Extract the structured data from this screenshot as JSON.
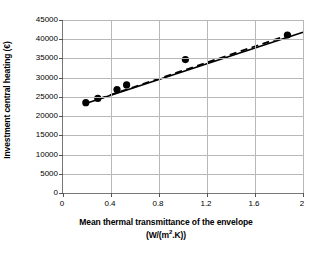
{
  "chart_data": {
    "type": "scatter",
    "title": "",
    "xlabel": "Mean thermal transmittance of the envelope (W/(m2.K))",
    "ylabel": "Investment central heating (€)",
    "xlim": [
      0,
      2
    ],
    "ylim": [
      0,
      45000
    ],
    "grid": true,
    "legend": "none",
    "x": [
      0.19,
      0.29,
      0.45,
      0.53,
      1.02,
      1.87
    ],
    "y": [
      23500,
      24600,
      26900,
      28100,
      34700,
      41100
    ],
    "points": [
      {
        "x": 0.19,
        "y": 23500
      },
      {
        "x": 0.29,
        "y": 24600
      },
      {
        "x": 0.45,
        "y": 26900
      },
      {
        "x": 0.53,
        "y": 28100
      },
      {
        "x": 1.02,
        "y": 34700
      },
      {
        "x": 1.87,
        "y": 41100
      }
    ],
    "series": [
      {
        "name": "data-points",
        "style": "markers",
        "marker": "filled-circle",
        "color": "#000000",
        "values": [
          23500,
          24600,
          26900,
          28100,
          34700,
          41100
        ]
      },
      {
        "name": "solid-trend-line",
        "style": "solid",
        "color": "#000000",
        "endpoints": [
          {
            "x": 0.17,
            "y": 23100
          },
          {
            "x": 2.0,
            "y": 41800
          }
        ]
      },
      {
        "name": "dashed-trend-line",
        "style": "dashed",
        "color": "#000000",
        "endpoints": [
          {
            "x": 0.3,
            "y": 24500
          },
          {
            "x": 1.9,
            "y": 41300
          }
        ]
      }
    ],
    "x_ticks": [
      {
        "value": 0,
        "label": "0"
      },
      {
        "value": 0.4,
        "label": "0.4"
      },
      {
        "value": 0.8,
        "label": "0.8"
      },
      {
        "value": 1.2,
        "label": "1.2"
      },
      {
        "value": 1.6,
        "label": "1.6"
      },
      {
        "value": 2,
        "label": "2"
      }
    ],
    "y_ticks": [
      {
        "value": 45000,
        "label": "45000"
      },
      {
        "value": 40000,
        "label": "40000"
      },
      {
        "value": 35000,
        "label": "35000"
      },
      {
        "value": 30000,
        "label": "30000"
      },
      {
        "value": 25000,
        "label": "25000"
      },
      {
        "value": 20000,
        "label": "20000"
      },
      {
        "value": 15000,
        "label": "15000"
      },
      {
        "value": 10000,
        "label": "10000"
      },
      {
        "value": 5000,
        "label": "5000"
      },
      {
        "value": 0,
        "label": "0"
      }
    ]
  },
  "axes": {
    "y_title": "Investment central heating (€)",
    "x_title_line1": "Mean thermal transmittance of the envelope",
    "x_title_line2_prefix": "(W/(m",
    "x_title_line2_sup": "2",
    "x_title_line2_suffix": ".K))"
  },
  "colors": {
    "grid": "#b8b8b8",
    "axis": "#777777",
    "marker": "#000000",
    "line": "#000000",
    "background": "#ffffff"
  }
}
